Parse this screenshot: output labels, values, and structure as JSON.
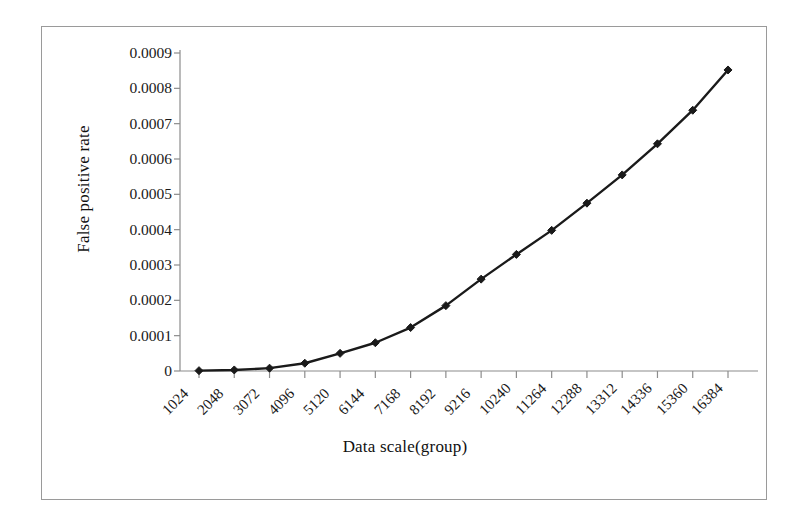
{
  "chart_data": {
    "type": "line",
    "title": "",
    "xlabel": "Data scale(group)",
    "ylabel": "False positive rate",
    "categories": [
      "1024",
      "2048",
      "3072",
      "4096",
      "5120",
      "6144",
      "7168",
      "8192",
      "9216",
      "10240",
      "11264",
      "12288",
      "13312",
      "14336",
      "15360",
      "16384"
    ],
    "values": [
      1e-06,
      3e-06,
      8e-06,
      2.2e-05,
      5e-05,
      8e-05,
      0.000123,
      0.000185,
      0.00026,
      0.00033,
      0.000398,
      0.000475,
      0.000555,
      0.000643,
      0.000738,
      0.000852
    ],
    "series": [
      {
        "name": "False positive rate",
        "values": [
          1e-06,
          3e-06,
          8e-06,
          2.2e-05,
          5e-05,
          8e-05,
          0.000123,
          0.000185,
          0.00026,
          0.00033,
          0.000398,
          0.000475,
          0.000555,
          0.000643,
          0.000738,
          0.000852
        ]
      }
    ],
    "ylim": [
      0,
      0.0009
    ],
    "y_ticks": [
      0,
      0.0001,
      0.0002,
      0.0003,
      0.0004,
      0.0005,
      0.0006,
      0.0007,
      0.0008,
      0.0009
    ],
    "y_tick_labels": [
      "0",
      "0.0001",
      "0.0002",
      "0.0003",
      "0.0004",
      "0.0005",
      "0.0006",
      "0.0007",
      "0.0008",
      "0.0009"
    ],
    "grid": false,
    "legend": false,
    "legend_position": "none",
    "marker": "diamond",
    "line_color": "#1a1a1a",
    "marker_color": "#1a1a1a",
    "axis_color": "#8c8c8c",
    "frame_color": "#9a9a9a",
    "background_color": "#ffffff",
    "x_tick_label_rotation": -45
  }
}
